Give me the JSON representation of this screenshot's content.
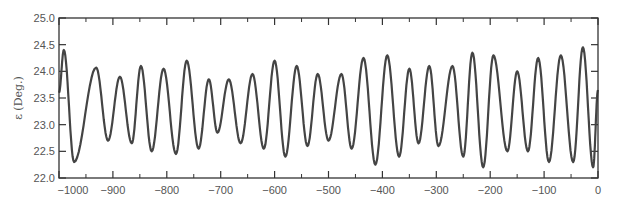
{
  "chart_data": {
    "type": "line",
    "title": "",
    "xlabel": "",
    "ylabel": "ε (Deg.)",
    "xlim": [
      -1000,
      0
    ],
    "ylim": [
      22.0,
      25.0
    ],
    "grid": false,
    "legend": null,
    "xticks": [
      -1000,
      -900,
      -800,
      -700,
      -600,
      -500,
      -400,
      -300,
      -200,
      -100,
      0
    ],
    "xtick_labels": [
      "−1000",
      "−900",
      "−800",
      "−700",
      "−600",
      "−500",
      "−400",
      "−300",
      "−200",
      "−100",
      "0"
    ],
    "xminor_ticks": [
      -950,
      -850,
      -750,
      -650,
      -550,
      -450,
      -350,
      -250,
      -150,
      -50
    ],
    "yticks": [
      22.0,
      22.5,
      23.0,
      23.5,
      24.0,
      24.5,
      25.0
    ],
    "ytick_labels": [
      "22.0",
      "22.5",
      "23.0",
      "23.5",
      "24.0",
      "24.5",
      "25.0"
    ],
    "line_color": "#444444",
    "series": [
      {
        "name": "obliquity",
        "note": "extrema (peaks/troughs) read from the plot; curve is smooth oscillation through these points",
        "x": [
          -1000,
          -991,
          -972,
          -931,
          -909,
          -887,
          -865,
          -848,
          -828,
          -806,
          -783,
          -763,
          -741,
          -722,
          -706,
          -685,
          -663,
          -641,
          -620,
          -600,
          -580,
          -559,
          -539,
          -520,
          -500,
          -476,
          -457,
          -435,
          -413,
          -391,
          -369,
          -350,
          -333,
          -313,
          -296,
          -270,
          -250,
          -233,
          -213,
          -194,
          -168,
          -150,
          -130,
          -111,
          -91,
          -69,
          -46,
          -28,
          -9,
          0
        ],
        "values": [
          23.6,
          24.4,
          22.3,
          24.07,
          22.7,
          23.9,
          22.65,
          24.1,
          22.5,
          24.05,
          22.45,
          24.2,
          22.55,
          23.85,
          22.85,
          23.85,
          22.65,
          23.95,
          22.55,
          24.2,
          22.4,
          24.1,
          22.6,
          23.95,
          22.7,
          23.95,
          22.55,
          24.25,
          22.25,
          24.3,
          22.4,
          24.05,
          22.65,
          24.1,
          22.6,
          24.1,
          22.4,
          24.35,
          22.2,
          24.3,
          22.5,
          24.0,
          22.5,
          24.25,
          22.3,
          24.3,
          22.3,
          24.45,
          22.2,
          23.65
        ]
      }
    ]
  }
}
